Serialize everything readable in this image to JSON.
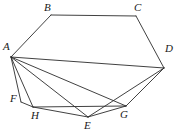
{
  "figure": {
    "kind": "geometry-diagram",
    "caption": "",
    "stroke_color": "#2b2b2b",
    "label_color": "#1a1a1a",
    "background_color": "#ffffff",
    "stroke_width": "0.9",
    "width": 176,
    "height": 133
  },
  "vertices": [
    {
      "id": "A",
      "label": "A",
      "x": 11,
      "y": 57,
      "label_x": 3,
      "label_y": 41
    },
    {
      "id": "B",
      "label": "B",
      "x": 51,
      "y": 15,
      "label_x": 44,
      "label_y": 2
    },
    {
      "id": "C",
      "label": "C",
      "x": 136,
      "y": 16,
      "label_x": 134,
      "label_y": 2
    },
    {
      "id": "D",
      "label": "D",
      "x": 164,
      "y": 68,
      "label_x": 165,
      "label_y": 43
    },
    {
      "id": "E",
      "label": "E",
      "x": 88,
      "y": 117,
      "label_x": 84,
      "label_y": 120
    },
    {
      "id": "F",
      "label": "F",
      "x": 21,
      "y": 102,
      "label_x": 10,
      "label_y": 93
    },
    {
      "id": "G",
      "label": "G",
      "x": 126,
      "y": 106,
      "label_x": 120,
      "label_y": 109
    },
    {
      "id": "H",
      "label": "H",
      "x": 33,
      "y": 107,
      "label_x": 31,
      "label_y": 110
    }
  ],
  "edges": [
    {
      "id": "AB",
      "from": "A",
      "to": "B",
      "kind": "boundary"
    },
    {
      "id": "BC",
      "from": "B",
      "to": "C",
      "kind": "boundary"
    },
    {
      "id": "CD",
      "from": "C",
      "to": "D",
      "kind": "boundary"
    },
    {
      "id": "DG",
      "from": "D",
      "to": "G",
      "kind": "boundary"
    },
    {
      "id": "DE",
      "from": "D",
      "to": "E",
      "kind": "boundary"
    },
    {
      "id": "EG",
      "from": "E",
      "to": "G",
      "kind": "boundary"
    },
    {
      "id": "EH",
      "from": "E",
      "to": "H",
      "kind": "boundary"
    },
    {
      "id": "HG",
      "from": "H",
      "to": "G",
      "kind": "boundary"
    },
    {
      "id": "FH",
      "from": "F",
      "to": "H",
      "kind": "boundary"
    },
    {
      "id": "AF",
      "from": "A",
      "to": "F",
      "kind": "boundary"
    },
    {
      "id": "AD",
      "from": "A",
      "to": "D",
      "kind": "diagonal"
    },
    {
      "id": "AG",
      "from": "A",
      "to": "G",
      "kind": "diagonal"
    },
    {
      "id": "AE",
      "from": "A",
      "to": "E",
      "kind": "diagonal"
    },
    {
      "id": "AH",
      "from": "A",
      "to": "H",
      "kind": "diagonal"
    }
  ]
}
